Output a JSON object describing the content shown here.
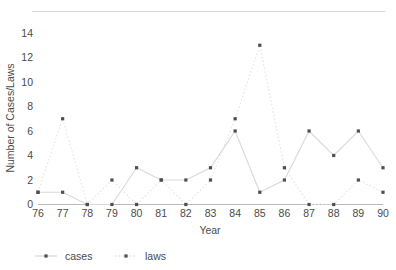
{
  "chart_data": {
    "type": "line",
    "title": "",
    "xlabel": "Year",
    "ylabel": "Number of Cases/Laws",
    "categories": [
      "76",
      "77",
      "78",
      "79",
      "80",
      "81",
      "82",
      "83",
      "84",
      "85",
      "86",
      "87",
      "88",
      "89",
      "90"
    ],
    "x": [
      76,
      77,
      78,
      79,
      80,
      81,
      82,
      83,
      84,
      85,
      86,
      87,
      88,
      89,
      90
    ],
    "xlim": [
      76,
      90
    ],
    "ylim": [
      0,
      14
    ],
    "yticks": [
      0,
      2,
      4,
      6,
      8,
      10,
      12,
      14
    ],
    "xticks": [
      "76",
      "77",
      "78",
      "79",
      "80",
      "81",
      "82",
      "83",
      "84",
      "85",
      "86",
      "87",
      "88",
      "89",
      "90"
    ],
    "grid": false,
    "legend_position": "bottom-left",
    "series": [
      {
        "name": "cases",
        "style": "solid",
        "marker": "square",
        "values": [
          1,
          1,
          0,
          0,
          3,
          2,
          2,
          3,
          6,
          1,
          2,
          6,
          4,
          6,
          3
        ]
      },
      {
        "name": "laws",
        "style": "dotted",
        "marker": "square",
        "values": [
          1,
          7,
          0,
          2,
          0,
          2,
          0,
          2,
          7,
          13,
          3,
          0,
          0,
          2,
          1
        ]
      }
    ]
  },
  "axes": {
    "y_label": "Number of Cases/Laws",
    "x_label": "Year",
    "y_ticks": [
      "0",
      "2",
      "4",
      "6",
      "8",
      "10",
      "12",
      "14"
    ],
    "x_ticks": [
      "76",
      "77",
      "78",
      "79",
      "80",
      "81",
      "82",
      "83",
      "84",
      "85",
      "86",
      "87",
      "88",
      "89",
      "90"
    ]
  },
  "legend": {
    "items": [
      {
        "label": "cases"
      },
      {
        "label": "laws"
      }
    ]
  },
  "colors": {
    "cases_line": "#d9d9d9",
    "laws_line": "#e4e4e4",
    "marker": "#4e4e4e",
    "axis": "#b9b9b9",
    "text": "#4a4a4a",
    "background": "#ffffff"
  }
}
